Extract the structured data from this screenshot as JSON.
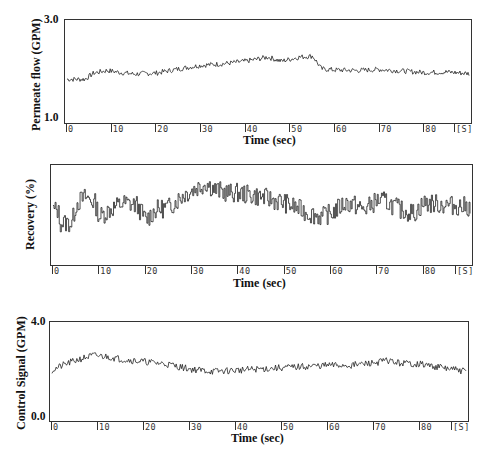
{
  "chart_data": [
    {
      "type": "line",
      "title": "",
      "ylabel": "Permeate flow (GPM)",
      "xlabel": "Time (sec)",
      "yticks": [
        "3.0",
        "1.0"
      ],
      "ylim": [
        1.0,
        3.0
      ],
      "xticks": [
        "0",
        "10",
        "20",
        "30",
        "40",
        "50",
        "60",
        "70",
        "80",
        "[S]"
      ],
      "xlim": [
        0,
        90
      ],
      "grid": false,
      "series": [
        {
          "name": "Permeate flow",
          "x": [
            0,
            4,
            6,
            9,
            12,
            15,
            20,
            25,
            30,
            35,
            40,
            45,
            48,
            52,
            55,
            57,
            60,
            65,
            70,
            75,
            80,
            85,
            90
          ],
          "values": [
            1.85,
            1.85,
            1.97,
            2.02,
            1.98,
            1.95,
            1.97,
            2.05,
            2.12,
            2.15,
            2.2,
            2.28,
            2.2,
            2.28,
            2.3,
            2.05,
            2.03,
            2.02,
            2.04,
            2.01,
            1.98,
            1.99,
            1.96
          ]
        }
      ]
    },
    {
      "type": "line",
      "title": "",
      "ylabel": "Recovery (%)",
      "xlabel": "Time (sec)",
      "yticks": [],
      "xticks": [
        "0",
        "10",
        "20",
        "30",
        "40",
        "50",
        "60",
        "70",
        "80",
        "[S]"
      ],
      "xlim": [
        0,
        90
      ],
      "grid": false,
      "series": [
        {
          "name": "Recovery",
          "x": [
            0,
            1,
            1.5,
            4,
            5,
            7,
            9,
            10,
            12,
            15,
            18,
            20,
            22,
            25,
            28,
            30,
            33,
            35,
            38,
            40,
            45,
            50,
            55,
            58,
            60,
            63,
            65,
            67,
            70,
            72,
            75,
            78,
            80,
            85,
            90
          ],
          "values": [
            0.55,
            0.55,
            0.42,
            0.42,
            0.62,
            0.68,
            0.62,
            0.48,
            0.55,
            0.62,
            0.6,
            0.45,
            0.55,
            0.58,
            0.7,
            0.75,
            0.82,
            0.75,
            0.72,
            0.72,
            0.68,
            0.62,
            0.52,
            0.48,
            0.52,
            0.62,
            0.6,
            0.55,
            0.65,
            0.63,
            0.55,
            0.52,
            0.62,
            0.6,
            0.58
          ]
        }
      ]
    },
    {
      "type": "line",
      "title": "",
      "ylabel": "Control Signal (GPM)",
      "xlabel": "Time (sec)",
      "yticks": [
        "4.0",
        "0.0"
      ],
      "ylim": [
        0.0,
        4.0
      ],
      "xticks": [
        "0",
        "10",
        "20",
        "30",
        "40",
        "50",
        "60",
        "70",
        "80",
        "[S]"
      ],
      "xlim": [
        0,
        90
      ],
      "grid": false,
      "series": [
        {
          "name": "Control Signal",
          "x": [
            0,
            3,
            6,
            9,
            12,
            15,
            20,
            25,
            30,
            35,
            40,
            45,
            50,
            55,
            60,
            65,
            70,
            73,
            75,
            80,
            85,
            90
          ],
          "values": [
            2.05,
            2.3,
            2.5,
            2.65,
            2.6,
            2.5,
            2.4,
            2.3,
            2.1,
            2.0,
            2.05,
            2.1,
            2.15,
            2.2,
            2.25,
            2.25,
            2.35,
            2.45,
            2.35,
            2.3,
            2.15,
            2.0
          ]
        }
      ]
    }
  ],
  "panels": {
    "p1": {
      "ylabel": "Permeate flow (GPM)",
      "ytop": "3.0",
      "ybottom": "1.0",
      "xlabel": "Time (sec)"
    },
    "p2": {
      "ylabel": "Recovery (%)",
      "xlabel": "Time (sec)"
    },
    "p3": {
      "ylabel": "Control Signal (GPM)",
      "ytop": "4.0",
      "ybottom": "0.0",
      "xlabel": "Time (sec)"
    },
    "xticks": [
      "0",
      "10",
      "20",
      "30",
      "40",
      "50",
      "60",
      "70",
      "80",
      "[S]"
    ]
  }
}
